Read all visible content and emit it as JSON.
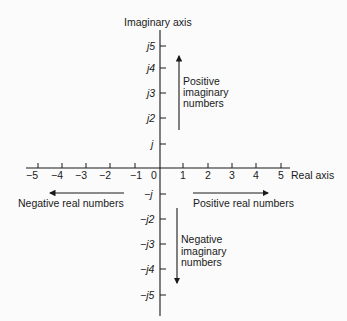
{
  "diagram": {
    "title_imaginary_axis": "Imaginary axis",
    "title_real_axis": "Real axis",
    "real_ticks": [
      "−5",
      "−4",
      "−3",
      "−2",
      "−1",
      "0",
      "1",
      "2",
      "3",
      "4",
      "5"
    ],
    "imaginary_ticks_positive": [
      "j",
      "j2",
      "j3",
      "j4",
      "j5"
    ],
    "imaginary_ticks_negative": [
      "−j",
      "−j2",
      "−j3",
      "−j4",
      "−j5"
    ],
    "annotations": {
      "positive_imaginary": [
        "Positive",
        "imaginary",
        "numbers"
      ],
      "negative_imaginary": [
        "Negative",
        "imaginary",
        "numbers"
      ],
      "positive_real": "Positive real numbers",
      "negative_real": "Negative real numbers"
    },
    "colors": {
      "background": "#fbfbfb",
      "ink": "#1a1a1a"
    }
  }
}
